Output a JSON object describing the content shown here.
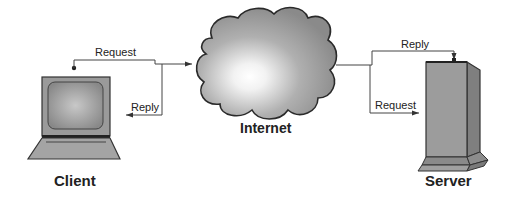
{
  "diagram": {
    "nodes": {
      "client": {
        "label": "Client",
        "icon": "laptop-icon"
      },
      "internet": {
        "label": "Internet",
        "icon": "cloud-icon"
      },
      "server": {
        "label": "Server",
        "icon": "server-tower-icon"
      }
    },
    "edges": {
      "client_request": {
        "label": "Request",
        "from": "Client",
        "to": "Internet"
      },
      "client_reply": {
        "label": "Reply",
        "from": "Internet",
        "to": "Client"
      },
      "server_reply": {
        "label": "Reply",
        "from": "Internet",
        "to": "Server"
      },
      "server_request": {
        "label": "Request",
        "from": "Internet",
        "to": "Server"
      }
    }
  },
  "colors": {
    "line": "#333333",
    "device_fill": "#9a9a9a",
    "cloud_fill": "#8e8e8e",
    "cloud_highlight": "#ffffff"
  }
}
